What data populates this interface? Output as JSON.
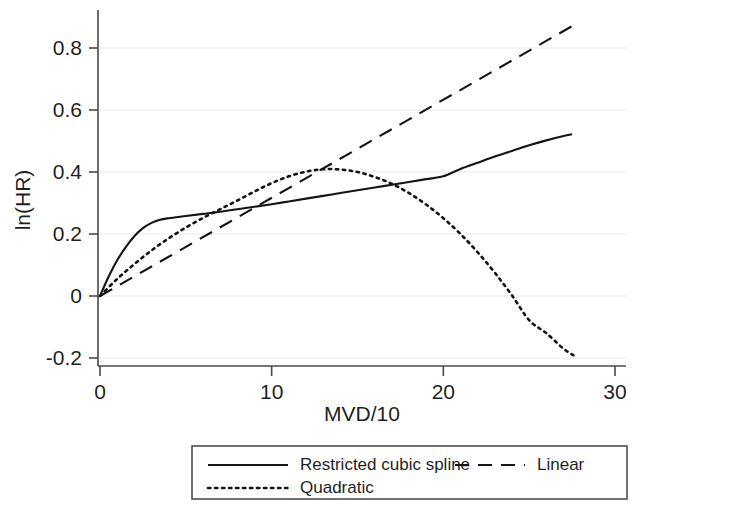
{
  "chart_data": {
    "type": "line",
    "title": "",
    "xlabel": "MVD/10",
    "ylabel": "ln(HR)",
    "xlim": [
      0,
      30
    ],
    "ylim": [
      -0.2,
      0.9
    ],
    "xticks": [
      0,
      10,
      20,
      30
    ],
    "xtick_labels": [
      "0",
      "10",
      "20",
      "30"
    ],
    "yticks": [
      -0.2,
      0,
      0.2,
      0.4,
      0.6,
      0.8
    ],
    "ytick_labels": [
      "-0.2",
      "0",
      "0.2",
      "0.4",
      "0.6",
      "0.8"
    ],
    "grid": "horizontal-faint",
    "legend_position": "below-axes",
    "series": [
      {
        "name": "Restricted cubic spline",
        "style": "solid",
        "color": "#141414",
        "x": [
          0,
          0.5,
          1,
          1.5,
          2,
          2.5,
          3,
          3.5,
          4,
          5,
          6,
          7,
          8,
          9,
          10,
          11,
          12,
          13,
          14,
          15,
          16,
          17,
          18,
          19,
          20,
          21,
          22,
          23,
          24,
          25,
          26,
          27,
          27.5
        ],
        "y": [
          0,
          0.062,
          0.115,
          0.158,
          0.193,
          0.219,
          0.236,
          0.246,
          0.251,
          0.258,
          0.265,
          0.272,
          0.28,
          0.288,
          0.296,
          0.305,
          0.314,
          0.323,
          0.332,
          0.341,
          0.35,
          0.359,
          0.368,
          0.377,
          0.386,
          0.41,
          0.43,
          0.45,
          0.468,
          0.486,
          0.502,
          0.516,
          0.522
        ]
      },
      {
        "name": "Linear",
        "style": "dashed",
        "color": "#141414",
        "x": [
          0,
          27.8
        ],
        "y": [
          0,
          0.88
        ]
      },
      {
        "name": "Quadratic",
        "style": "dotted",
        "color": "#141414",
        "x": [
          0,
          1,
          2,
          3,
          4,
          5,
          6,
          7,
          8,
          9,
          10,
          11,
          12,
          13,
          14,
          15,
          16,
          17,
          18,
          19,
          20,
          21,
          22,
          23,
          24,
          25,
          26,
          27,
          27.6
        ],
        "y": [
          0,
          0.055,
          0.103,
          0.147,
          0.186,
          0.221,
          0.252,
          0.28,
          0.308,
          0.337,
          0.364,
          0.386,
          0.401,
          0.409,
          0.408,
          0.4,
          0.384,
          0.362,
          0.332,
          0.295,
          0.251,
          0.2,
          0.141,
          0.075,
          0.002,
          -0.078,
          -0.12,
          -0.17,
          -0.192
        ]
      }
    ],
    "annotations": []
  },
  "legend": {
    "entries": [
      {
        "label": "Restricted cubic spline",
        "style": "solid"
      },
      {
        "label": "Linear",
        "style": "dashed"
      },
      {
        "label": "Quadratic",
        "style": "dotted"
      }
    ]
  },
  "colors": {
    "ink": "#141414",
    "axis": "#4a4a4a",
    "grid": "#e9e9ec",
    "background": "#ffffff"
  }
}
